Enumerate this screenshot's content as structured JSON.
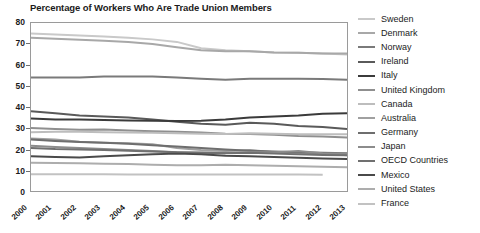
{
  "chart_data": {
    "type": "line",
    "title": "Percentage of Workers Who Are Trade Union Members",
    "xlabel": "",
    "ylabel": "",
    "x": [
      2000,
      2001,
      2002,
      2003,
      2004,
      2005,
      2006,
      2007,
      2008,
      2009,
      2010,
      2011,
      2012,
      2013
    ],
    "xlim": [
      2000,
      2013
    ],
    "ylim": [
      0,
      80
    ],
    "y_ticks": [
      0,
      10,
      20,
      30,
      40,
      50,
      60,
      70,
      80
    ],
    "grid": false,
    "legend_position": "right",
    "series": [
      {
        "name": "Sweden",
        "color": "#c9c9c9",
        "values": [
          75.0,
          74.5,
          74.0,
          73.6,
          73.0,
          72.2,
          71.0,
          68.0,
          67.0,
          66.5,
          66.0,
          65.8,
          65.5,
          65.0
        ]
      },
      {
        "name": "Denmark",
        "color": "#a8a8a8",
        "values": [
          73.0,
          72.5,
          72.0,
          71.5,
          71.0,
          70.0,
          68.5,
          67.0,
          66.5,
          66.5,
          66.0,
          65.8,
          65.5,
          65.5
        ]
      },
      {
        "name": "Norway",
        "color": "#7a7a7a",
        "values": [
          54.0,
          54.0,
          54.0,
          54.5,
          54.5,
          54.5,
          54.0,
          53.5,
          53.0,
          53.5,
          53.5,
          53.5,
          53.3,
          53.0
        ]
      },
      {
        "name": "Ireland",
        "color": "#5a5a5a",
        "values": [
          38.0,
          37.0,
          36.0,
          35.5,
          35.0,
          34.0,
          33.0,
          32.0,
          31.5,
          32.5,
          32.0,
          31.0,
          30.5,
          29.5
        ]
      },
      {
        "name": "Italy",
        "color": "#3b3b3b",
        "values": [
          34.5,
          34.0,
          34.0,
          33.8,
          33.6,
          33.5,
          33.3,
          33.5,
          34.0,
          35.0,
          35.5,
          36.0,
          36.8,
          37.0
        ]
      },
      {
        "name": "United Kingdom",
        "color": "#8f8f8f",
        "values": [
          30.0,
          29.5,
          29.2,
          29.3,
          28.8,
          28.5,
          28.2,
          27.8,
          27.3,
          27.2,
          26.8,
          26.2,
          26.0,
          25.5
        ]
      },
      {
        "name": "Canada",
        "color": "#bdbdbd",
        "values": [
          28.0,
          28.2,
          28.2,
          28.0,
          27.8,
          27.7,
          27.5,
          27.3,
          27.2,
          27.5,
          27.3,
          27.0,
          27.0,
          27.0
        ]
      },
      {
        "name": "Australia",
        "color": "#a0a0a0",
        "values": [
          25.0,
          24.5,
          23.5,
          23.0,
          22.7,
          22.3,
          20.5,
          19.5,
          19.0,
          19.5,
          18.5,
          18.2,
          18.0,
          17.0
        ]
      },
      {
        "name": "Germany",
        "color": "#6e6e6e",
        "values": [
          24.5,
          23.8,
          23.3,
          23.0,
          22.5,
          21.8,
          21.2,
          20.5,
          19.8,
          19.2,
          18.8,
          18.5,
          18.2,
          18.0
        ]
      },
      {
        "name": "Japan",
        "color": "#8c8c8c",
        "values": [
          21.5,
          21.0,
          20.5,
          20.0,
          19.5,
          19.0,
          18.5,
          18.3,
          18.2,
          18.5,
          18.4,
          19.0,
          18.0,
          17.8
        ]
      },
      {
        "name": "OECD Countries",
        "color": "#707070",
        "values": [
          20.5,
          20.0,
          19.8,
          19.5,
          19.2,
          18.8,
          18.5,
          18.2,
          18.0,
          18.2,
          17.8,
          17.5,
          17.2,
          17.0
        ]
      },
      {
        "name": "Mexico",
        "color": "#4a4a4a",
        "values": [
          16.5,
          16.2,
          16.0,
          16.5,
          17.0,
          17.5,
          17.8,
          17.5,
          16.8,
          16.5,
          16.2,
          15.8,
          15.5,
          15.2
        ]
      },
      {
        "name": "United States",
        "color": "#adadad",
        "values": [
          13.5,
          13.3,
          13.2,
          13.0,
          12.8,
          12.5,
          12.3,
          12.3,
          12.5,
          12.3,
          12.0,
          11.8,
          11.5,
          11.3
        ]
      },
      {
        "name": "France",
        "color": "#c2c2c2",
        "values": [
          8.0,
          8.0,
          8.0,
          8.0,
          7.9,
          7.8,
          7.8,
          7.8,
          7.8,
          7.8,
          7.8,
          7.8,
          7.7,
          null
        ]
      }
    ]
  }
}
